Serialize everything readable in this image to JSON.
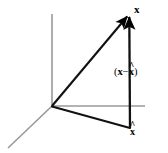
{
  "figure": {
    "background_color": "#ffffff",
    "width": 168,
    "height": 153
  },
  "axes": {
    "color": "#999999",
    "origin": {
      "x": 52,
      "y": 106
    },
    "items": [
      {
        "name": "vertical-axis",
        "x1": 52,
        "y1": 14,
        "x2": 52,
        "y2": 106
      },
      {
        "name": "horizontal-axis",
        "x1": 52,
        "y1": 106,
        "x2": 145,
        "y2": 106
      },
      {
        "name": "depth-axis",
        "x1": 52,
        "y1": 106,
        "x2": 8,
        "y2": 148
      }
    ]
  },
  "vectors": {
    "color": "#000000",
    "items": [
      {
        "name": "vector-x",
        "label": "x",
        "x1": 52,
        "y1": 106,
        "x2": 128,
        "y2": 15,
        "arrow": true
      },
      {
        "name": "vector-residual",
        "label": "(x − x̂)",
        "x1": 130,
        "y1": 128,
        "x2": 129,
        "y2": 15,
        "arrow": true
      },
      {
        "name": "vector-x-hat",
        "label": "x̂",
        "x1": 52,
        "y1": 106,
        "x2": 130,
        "y2": 128,
        "arrow": false
      }
    ]
  },
  "labels": {
    "x_vector": "x",
    "x_hat_base": "x",
    "x_hat_mark": "^",
    "residual_open_paren": "(",
    "residual_x": "x",
    "residual_minus": "−",
    "residual_hat_base": "x",
    "residual_hat_mark": "^",
    "residual_close_paren": ")"
  }
}
